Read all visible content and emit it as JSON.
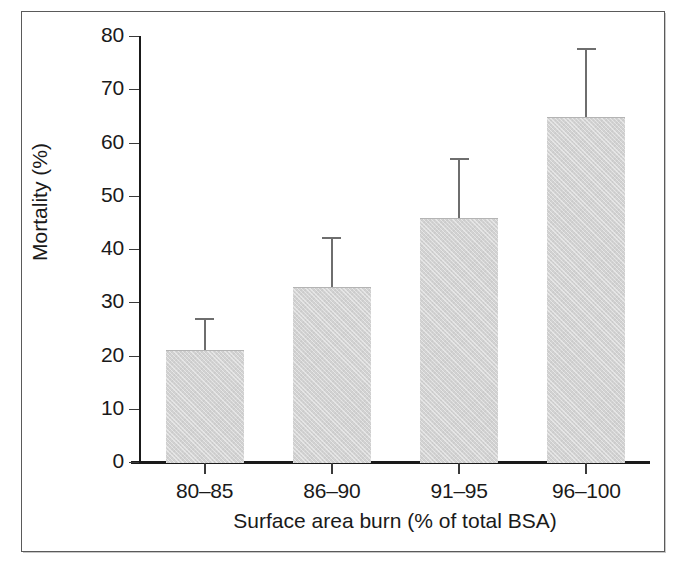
{
  "chart_data": {
    "type": "bar",
    "title": "",
    "xlabel": "Surface area burn (% of total BSA)",
    "ylabel": "Mortality (%)",
    "categories": [
      "80–85",
      "86–90",
      "91–95",
      "96–100"
    ],
    "values": [
      21.0,
      32.8,
      45.8,
      64.8
    ],
    "errors_upper": [
      27.0,
      42.3,
      57.1,
      77.7
    ],
    "error_bar_type": "upper-only",
    "yticks": [
      0,
      10,
      20,
      30,
      40,
      50,
      60,
      70,
      80
    ],
    "ytick_labels": [
      "0",
      "10",
      "20",
      "30",
      "40",
      "50",
      "60",
      "70",
      "80"
    ],
    "ylim": [
      0,
      80
    ],
    "grid": false,
    "legend": null,
    "bar_color": "#d2d2d2",
    "axis_color": "#1a1a1a",
    "error_bar_color": "#6e6e6e"
  },
  "figure": {
    "frame_color": "#5a5a5a",
    "background": "#ffffff"
  }
}
